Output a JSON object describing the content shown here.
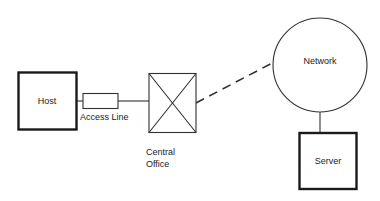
{
  "diagram": {
    "background_color": "#ffffff",
    "line_color": "#303030",
    "thick_line_color": "#1a1a1a",
    "text_color": "#1a1a1a",
    "nodes": {
      "host": {
        "label": "Host",
        "shape": "rectangle"
      },
      "access_line": {
        "label": "Access Line",
        "shape": "rectangle"
      },
      "central_office": {
        "label_line1": "Central",
        "label_line2": "Office",
        "shape": "rectangle-with-x"
      },
      "network": {
        "label": "Network",
        "shape": "circle"
      },
      "server": {
        "label": "Server",
        "shape": "rectangle"
      }
    },
    "edges": {
      "host_to_accessline": {
        "style": "solid"
      },
      "accessline_to_centraloffice": {
        "style": "solid"
      },
      "centraloffice_to_network": {
        "style": "dashed"
      },
      "network_to_server": {
        "style": "solid"
      }
    }
  }
}
